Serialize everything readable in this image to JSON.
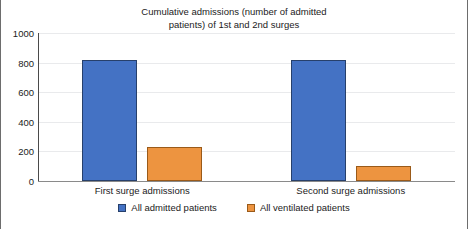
{
  "chart_data": {
    "type": "bar",
    "title": "Cumulative admissions (number of admitted\npatients) of 1st and 2nd surges",
    "xlabel": "",
    "ylabel": "",
    "categories": [
      "First surge admissions",
      "Second surge admissions"
    ],
    "series": [
      {
        "name": "All admitted patients",
        "color": "#4472c4",
        "values": [
          820,
          815
        ]
      },
      {
        "name": "All ventilated patients",
        "color": "#ed9440",
        "values": [
          230,
          100
        ]
      }
    ],
    "ylim": [
      0,
      1000
    ],
    "yticks": [
      0,
      200,
      400,
      600,
      800,
      1000
    ],
    "ytick_labels": [
      "0",
      "200",
      "400",
      "600",
      "800",
      "1000"
    ],
    "grid": true,
    "legend_position": "bottom"
  },
  "colors": {
    "series_0": "#4472c4",
    "series_1": "#ed9440",
    "gridline": "#e9eaec",
    "axis": "#4a4a4a",
    "text": "#1b1b1b",
    "background": "#ffffff"
  }
}
